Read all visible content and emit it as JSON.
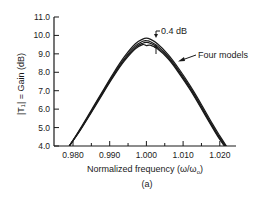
{
  "chart_data": {
    "type": "line",
    "title": "",
    "caption": "(a)",
    "xlabel": "Normalized frequency (ω/ω₀)",
    "ylabel": "|T₁| = Gain (dB)",
    "xlim": [
      0.9775,
      1.0255
    ],
    "ylim": [
      4.0,
      11.0
    ],
    "x_ticks": [
      0.98,
      0.99,
      1.0,
      1.01,
      1.02
    ],
    "x_tick_labels": [
      "0.980",
      "0.990",
      "1.000",
      "1.010",
      "1.020"
    ],
    "x_minor_ticks": [
      0.985,
      0.995,
      1.005,
      1.015,
      1.025
    ],
    "y_ticks": [
      4.0,
      5.0,
      6.0,
      7.0,
      8.0,
      9.0,
      10.0,
      11.0
    ],
    "y_tick_labels": [
      "4.0",
      "5.0",
      "6.0",
      "7.0",
      "8.0",
      "9.0",
      "10.0",
      "11.0"
    ],
    "grid": false,
    "legend": null,
    "x": [
      0.979,
      0.982,
      0.985,
      0.988,
      0.991,
      0.994,
      0.997,
      0.999,
      1.0,
      1.001,
      1.003,
      1.006,
      1.009,
      1.012,
      1.015,
      1.018,
      1.02,
      1.0218
    ],
    "series": [
      {
        "name": "Model 1",
        "values": [
          4.0,
          4.95,
          5.95,
          6.95,
          7.95,
          8.85,
          9.55,
          9.8,
          9.85,
          9.8,
          9.55,
          8.95,
          8.15,
          7.25,
          6.25,
          5.2,
          4.55,
          4.0
        ]
      },
      {
        "name": "Model 2",
        "values": [
          4.0,
          4.9,
          5.9,
          6.9,
          7.88,
          8.75,
          9.43,
          9.68,
          9.72,
          9.67,
          9.43,
          8.85,
          8.05,
          7.15,
          6.15,
          5.1,
          4.45,
          3.95
        ]
      },
      {
        "name": "Model 3",
        "values": [
          4.0,
          4.88,
          5.86,
          6.85,
          7.82,
          8.68,
          9.35,
          9.58,
          9.62,
          9.58,
          9.35,
          8.78,
          7.98,
          7.08,
          6.08,
          5.05,
          4.4,
          3.9
        ]
      },
      {
        "name": "Model 4",
        "values": [
          4.0,
          4.85,
          5.82,
          6.8,
          7.76,
          8.62,
          9.28,
          9.5,
          9.45,
          9.47,
          9.28,
          8.72,
          7.92,
          7.02,
          6.02,
          5.0,
          4.35,
          3.85
        ]
      }
    ],
    "annotations": [
      {
        "text": "0.4 dB",
        "x": 1.0025,
        "y": 9.85,
        "note": "spread between top and bottom curves at peak"
      },
      {
        "text": "Four models",
        "x": 1.0085,
        "y": 8.2,
        "note": "arrow pointing to curve bundle"
      }
    ]
  },
  "labels": {
    "xlabel": "Normalized frequency (ω/ω",
    "xlabel_sub": "o",
    "xlabel_close": ")",
    "ylabel": "|T₁| = Gain (dB)",
    "caption": "(a)",
    "annot_spread": "0.4 dB",
    "annot_models": "Four models"
  },
  "colors": {
    "ink": "#1a1a1a",
    "background": "#ffffff"
  }
}
